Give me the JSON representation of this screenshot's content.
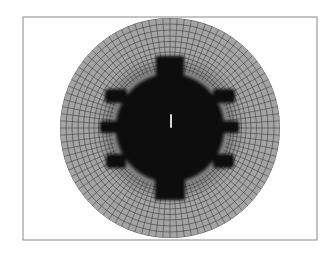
{
  "figure": {
    "type": "finite-element-mesh",
    "background": "#ffffff",
    "frame": {
      "x": 23,
      "y": 17,
      "width": 294,
      "height": 223,
      "stroke": "#8a8a8a"
    },
    "outer_disc": {
      "cx": 170,
      "cy": 128,
      "r": 110,
      "fill": "#a4a4a4",
      "mesh_color": "#3c3c3c",
      "radial_divisions": 96,
      "ring_radii": [
        110,
        104,
        98,
        92,
        86.5,
        81,
        76,
        71.5,
        67.5,
        64,
        61
      ]
    },
    "inner_body": {
      "cx": 170,
      "cy": 128,
      "r": 54,
      "fill": "#0b0b0b",
      "halo_color": "#2a2a2a",
      "teeth": [
        {
          "name": "top-tooth",
          "x": 156,
          "y": 56,
          "w": 28,
          "h": 26
        },
        {
          "name": "bottom-tooth",
          "x": 155,
          "y": 170,
          "w": 30,
          "h": 30
        }
      ],
      "lugs": [
        {
          "name": "left-upper-lug",
          "x": 105,
          "y": 89,
          "w": 22,
          "h": 14
        },
        {
          "name": "left-middle-lug",
          "x": 100,
          "y": 121,
          "w": 20,
          "h": 12
        },
        {
          "name": "left-lower-lug",
          "x": 106,
          "y": 154,
          "w": 20,
          "h": 14
        },
        {
          "name": "right-upper-lug",
          "x": 213,
          "y": 89,
          "w": 22,
          "h": 14
        },
        {
          "name": "right-middle-lug",
          "x": 220,
          "y": 121,
          "w": 19,
          "h": 12
        },
        {
          "name": "right-lower-lug",
          "x": 213,
          "y": 154,
          "w": 21,
          "h": 14
        }
      ],
      "center_slit": {
        "x": 170,
        "y": 114,
        "w": 2,
        "h": 14,
        "fill": "#d8d8d8"
      }
    }
  }
}
